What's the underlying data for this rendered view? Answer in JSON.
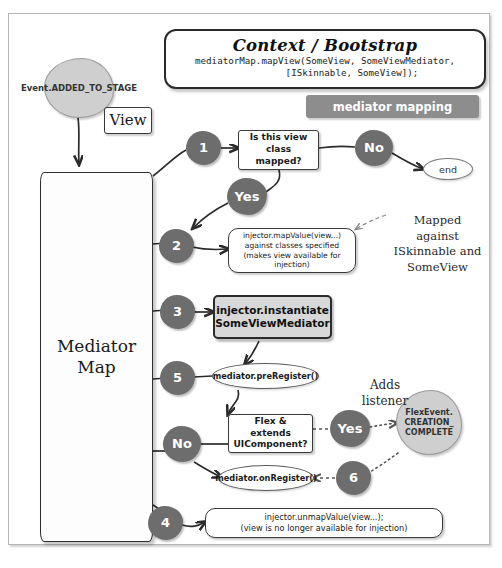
{
  "diagram": {
    "title_box": {
      "heading": "Context / Bootstrap",
      "code_line_1": "mediatorMap.mapView(SomeView, SomeViewMediator,",
      "code_line_2": "[ISkinnable, SomeView]);"
    },
    "banner_label": "mediator mapping",
    "event_start": "Event.ADDED_TO_STAGE",
    "view_box": "View",
    "mediator_map_label": "Mediator\nMap",
    "steps": [
      {
        "id": "1",
        "label": "1"
      },
      {
        "id": "2",
        "label": "2"
      },
      {
        "id": "3",
        "label": "3"
      },
      {
        "id": "5",
        "label": "5"
      },
      {
        "id": "6",
        "label": "6"
      },
      {
        "id": "4",
        "label": "4"
      }
    ],
    "decisions": {
      "yes_top": "Yes",
      "no_top": "No",
      "yes_flex": "Yes",
      "no_flex": "No"
    },
    "boxes": {
      "is_mapped": "Is this view class\nmapped?",
      "map_value": "injector.mapValue(view...)\nagainst classes specified\n(makes view available for\ninjection)",
      "instantiate": "injector.instantiate\nSomeViewMediator",
      "flex_extends": "Flex & extends\nUIComponent?",
      "unmap_value": "injector.unmapValue(view...);\n(view is no longer available for injection)"
    },
    "pills": {
      "end": "end",
      "pre_register": "mediator.preRegister()",
      "on_register": "mediator.onRegister()"
    },
    "flex_event": "FlexEvent.\nCREATION_\nCOMPLETE",
    "annotations": {
      "mapped_against": "Mapped\nagainst\nISkinnable and\nSomeView",
      "adds_listener": "Adds\nlistener"
    },
    "colors": {
      "decision_blob": "#6d6d6d",
      "event_blob": "#cfcfcf",
      "banner": "#8d8d8d",
      "emphasis_box": "#d8d8d8",
      "frame_border": "#b4b4b4"
    }
  }
}
